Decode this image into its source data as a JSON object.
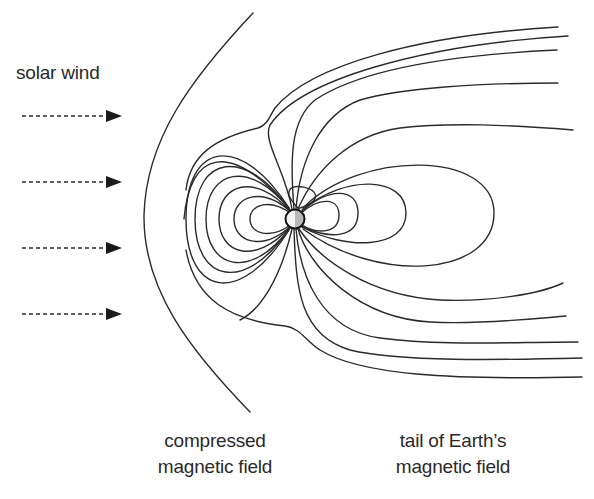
{
  "diagram": {
    "labels": {
      "solar_wind": "solar wind",
      "compressed_line1": "compressed",
      "compressed_line2": "magnetic field",
      "tail_line1": "tail of Earth’s",
      "tail_line2": "magnetic field"
    },
    "elements": {
      "earth": {
        "cx": 295,
        "cy": 219,
        "r": 9,
        "fill_dark": "#b8b8b8",
        "fill_light": "#f4f4f4"
      },
      "solar_wind_arrows": {
        "count": 4,
        "y": [
          116,
          182,
          248,
          314
        ],
        "x_start": 22,
        "x_end": 122
      },
      "bow_shock": {
        "top": [
          253,
          13
        ],
        "nose": [
          144,
          215
        ],
        "bottom": [
          250,
          412
        ]
      },
      "dayside_loops": 6,
      "nightside_closed_loops": 4,
      "tail_field_lines_north": 5,
      "tail_field_lines_south": 5
    },
    "colors": {
      "line": "#2b2b2b",
      "background": "#ffffff",
      "text": "#2a2a2a"
    }
  }
}
